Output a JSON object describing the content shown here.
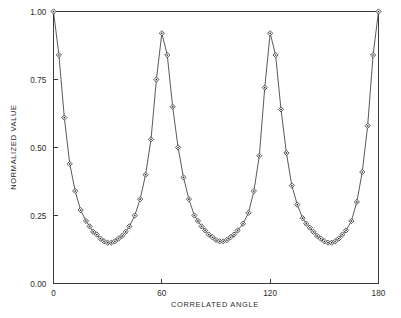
{
  "chart_data": {
    "type": "line",
    "title": "",
    "xlabel": "CORRELATED ANGLE",
    "ylabel": "NORMALIZED VALUE",
    "xlim": [
      0,
      180
    ],
    "ylim": [
      0,
      1.0
    ],
    "xticks": [
      0,
      60,
      120,
      180
    ],
    "xtick_labels": [
      "0",
      "60",
      "120",
      "180"
    ],
    "yticks": [
      0.0,
      0.25,
      0.5,
      0.75,
      1.0
    ],
    "ytick_labels": [
      "0.00",
      "0.25",
      "0.50",
      "0.75",
      "1.00"
    ],
    "grid": false,
    "legend": "none",
    "marker": "diamond-dot",
    "series": [
      {
        "name": "normalized correlation",
        "x": [
          0,
          3,
          6,
          9,
          12,
          15,
          18,
          20,
          22,
          24,
          26,
          28,
          30,
          32,
          34,
          36,
          38,
          40,
          42,
          45,
          48,
          51,
          54,
          57,
          60,
          63,
          66,
          69,
          72,
          75,
          78,
          80,
          82,
          84,
          86,
          88,
          90,
          92,
          94,
          96,
          98,
          100,
          102,
          105,
          108,
          111,
          114,
          117,
          120,
          123,
          126,
          129,
          132,
          135,
          138,
          140,
          142,
          144,
          146,
          148,
          150,
          152,
          154,
          156,
          158,
          160,
          162,
          165,
          168,
          171,
          174,
          177,
          180
        ],
        "y": [
          1.0,
          0.84,
          0.61,
          0.44,
          0.34,
          0.27,
          0.23,
          0.21,
          0.19,
          0.18,
          0.165,
          0.155,
          0.15,
          0.15,
          0.155,
          0.165,
          0.175,
          0.19,
          0.21,
          0.25,
          0.31,
          0.4,
          0.53,
          0.75,
          0.92,
          0.84,
          0.65,
          0.5,
          0.39,
          0.31,
          0.25,
          0.23,
          0.21,
          0.195,
          0.18,
          0.17,
          0.16,
          0.155,
          0.155,
          0.16,
          0.17,
          0.18,
          0.195,
          0.22,
          0.26,
          0.34,
          0.47,
          0.72,
          0.92,
          0.84,
          0.64,
          0.48,
          0.36,
          0.29,
          0.24,
          0.22,
          0.205,
          0.19,
          0.175,
          0.165,
          0.155,
          0.15,
          0.15,
          0.155,
          0.165,
          0.18,
          0.195,
          0.23,
          0.3,
          0.41,
          0.58,
          0.84,
          1.0
        ]
      }
    ]
  }
}
